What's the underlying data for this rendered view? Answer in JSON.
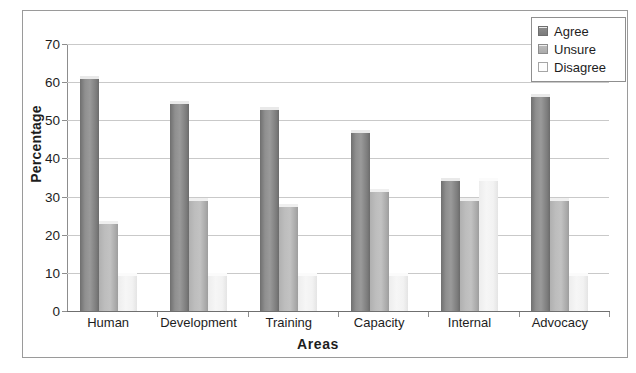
{
  "chart_data": {
    "type": "bar",
    "title": "",
    "xlabel": "Areas",
    "ylabel": "Percentage",
    "categories": [
      "Human",
      "Development",
      "Training",
      "Capacity",
      "Internal",
      "Advocacy"
    ],
    "series": [
      {
        "name": "Agree",
        "color": "#8a8a8a",
        "values": [
          61.5,
          55.0,
          53.5,
          47.5,
          35.0,
          57.0
        ]
      },
      {
        "name": "Unsure",
        "color": "#bdbdbd",
        "values": [
          23.5,
          29.5,
          28.0,
          32.0,
          29.5,
          29.5
        ]
      },
      {
        "name": "Disagree",
        "color": "#f4f4f4",
        "values": [
          10.0,
          10.0,
          10.0,
          10.0,
          35.0,
          10.0
        ]
      }
    ],
    "ylim": [
      0,
      70
    ],
    "ytick_values": [
      0,
      10,
      20,
      30,
      40,
      50,
      60,
      70
    ],
    "ytick_labels": [
      "0",
      "10",
      "20",
      "30",
      "40",
      "50",
      "60",
      "70"
    ],
    "grid": true,
    "legend_position": "top-right"
  },
  "legend": {
    "items": [
      {
        "label": "Agree"
      },
      {
        "label": "Unsure"
      },
      {
        "label": "Disagree"
      }
    ]
  }
}
